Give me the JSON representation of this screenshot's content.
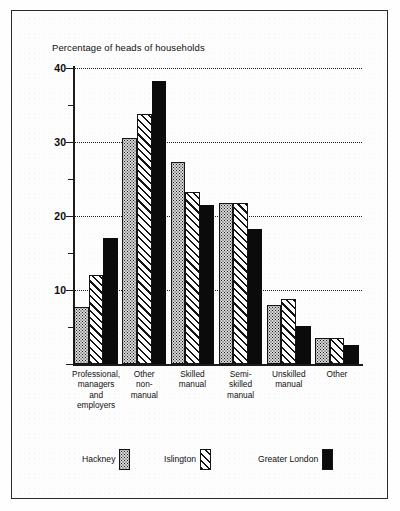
{
  "chart_data": {
    "type": "bar",
    "title": "Percentage of heads of households",
    "xlabel": "",
    "ylabel": "",
    "ylim": [
      0,
      40
    ],
    "yticks": [
      0,
      10,
      20,
      30,
      40
    ],
    "ytick_labels": [
      "",
      "10",
      "20",
      "30",
      "40"
    ],
    "yminor_ticks": [
      5,
      15,
      25,
      35
    ],
    "grid": "horizontal dotted at 10, 20, 30, 40",
    "legend_position": "bottom",
    "categories": [
      "Professional, managers and employers",
      "Other non-manual",
      "Skilled manual",
      "Semi-skilled manual",
      "Unskilled manual",
      "Other"
    ],
    "category_lines": [
      [
        "Professional,",
        "managers",
        "and",
        "employers"
      ],
      [
        "Other",
        "non-",
        "manual"
      ],
      [
        "Skilled",
        "manual"
      ],
      [
        "Semi-",
        "skilled",
        "manual"
      ],
      [
        "Unskilled",
        "manual"
      ],
      [
        "Other"
      ]
    ],
    "series": [
      {
        "name": "Hackney",
        "fill": "stipple",
        "color": "#d6d6d6",
        "values": [
          7.7,
          30.5,
          27.3,
          21.8,
          8.0,
          3.5
        ]
      },
      {
        "name": "Islington",
        "fill": "hatch",
        "color": "#ffffff",
        "values": [
          12.0,
          33.8,
          23.2,
          21.8,
          8.8,
          3.5
        ]
      },
      {
        "name": "Greater London",
        "fill": "solid",
        "color": "#0b0b0b",
        "values": [
          17.0,
          38.3,
          21.5,
          18.3,
          5.2,
          2.6
        ]
      }
    ]
  },
  "legend": {
    "items": [
      {
        "label": "Hackney"
      },
      {
        "label": "Islington"
      },
      {
        "label": "Greater London"
      }
    ]
  },
  "colors": {
    "axis": "#1b1b1b",
    "frame": "#2b2b2b",
    "text": "#101010",
    "solid_series": "#0b0b0b"
  }
}
